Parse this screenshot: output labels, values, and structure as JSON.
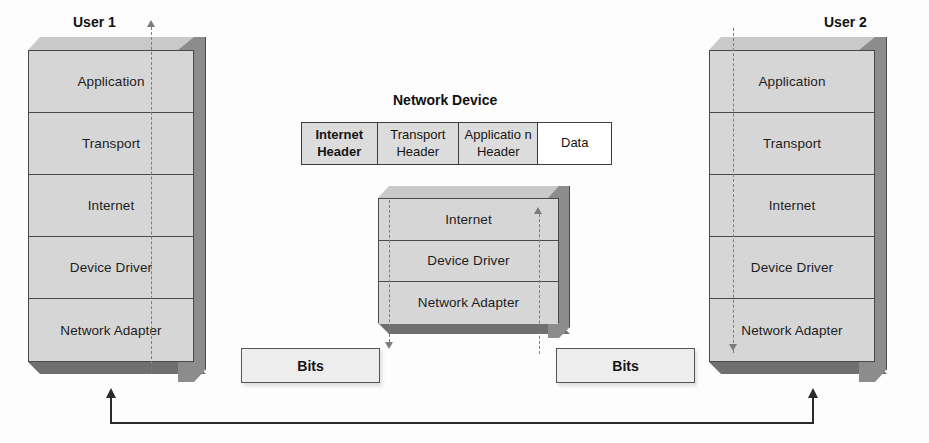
{
  "user1": {
    "title": "User 1",
    "layers": [
      {
        "label": "Application"
      },
      {
        "label": "Transport"
      },
      {
        "label": "Internet"
      },
      {
        "label": "Device Driver"
      },
      {
        "label": "Network Adapter"
      }
    ]
  },
  "user2": {
    "title": "User 2",
    "layers": [
      {
        "label": "Application"
      },
      {
        "label": "Transport"
      },
      {
        "label": "Internet"
      },
      {
        "label": "Device Driver"
      },
      {
        "label": "Network Adapter"
      }
    ]
  },
  "network_device": {
    "title": "Network Device",
    "layers": [
      {
        "label": "Internet"
      },
      {
        "label": "Device Driver"
      },
      {
        "label": "Network Adapter"
      }
    ]
  },
  "packet": {
    "cells": [
      {
        "label": "Internet Header",
        "bold": true,
        "plain": false
      },
      {
        "label": "Transport Header",
        "bold": false,
        "plain": false
      },
      {
        "label": "Applicatio n Header",
        "bold": false,
        "plain": false
      },
      {
        "label": "Data",
        "bold": false,
        "plain": true
      }
    ]
  },
  "bits": {
    "left_label": "Bits",
    "right_label": "Bits"
  },
  "colors": {
    "layer_face": "#d6d6d6",
    "layer_side": "#8c8c8c",
    "layer_top": "#c9c9c9",
    "layer_bottom": "#6f6f6f",
    "outline": "#4a4a4a",
    "dashed_flow": "#7d7d7d",
    "link": "#2b2b2b",
    "bits_face": "#ededed",
    "packet_cell": "#dcdcdc"
  }
}
